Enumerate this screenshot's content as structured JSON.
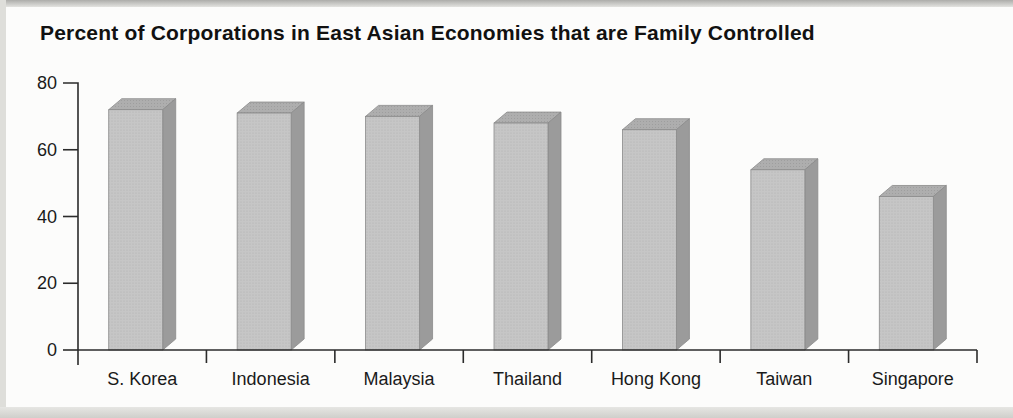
{
  "page": {
    "title": "Percent of Corporations in East Asian Economies that are Family Controlled"
  },
  "chart_data": {
    "type": "bar",
    "title": "Percent of Corporations in East Asian Economies that are Family Controlled",
    "categories": [
      "S. Korea",
      "Indonesia",
      "Malaysia",
      "Thailand",
      "Hong Kong",
      "Taiwan",
      "Singapore"
    ],
    "values": [
      72,
      71,
      70,
      68,
      66,
      54,
      46
    ],
    "xlabel": "",
    "ylabel": "",
    "ylim": [
      0,
      80
    ],
    "yticks": [
      0,
      20,
      40,
      60,
      80
    ],
    "grid": false,
    "legend": false,
    "bar_style": "3d",
    "colors": {
      "bar_front": "#c6c6c6",
      "bar_front_dot": "#b2b2b2",
      "bar_top": "#aeaeae",
      "bar_side": "#9b9b9b",
      "bar_edge": "#8a8a8a",
      "axis": "#2b2b2b",
      "text": "#1a1a1a",
      "background": "#fcfcfb"
    }
  }
}
